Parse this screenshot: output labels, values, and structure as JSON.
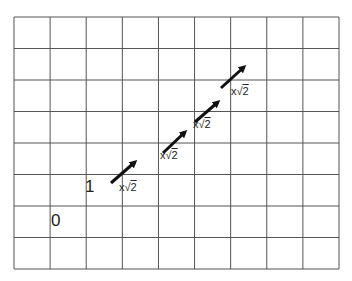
{
  "diagram": {
    "grid": {
      "columns": 9,
      "rows": 8,
      "left": 14,
      "top": 17,
      "right": 339,
      "bottom": 269,
      "line_color": "#555555"
    },
    "labels": [
      {
        "id": "zero",
        "text": "0",
        "x": 51,
        "y": 211
      },
      {
        "id": "one",
        "text": "1",
        "x": 85,
        "y": 177
      }
    ],
    "arrows": [
      {
        "from": [
          111,
          183
        ],
        "to": [
          135,
          162
        ],
        "label": {
          "prefix": "x",
          "radical": "√",
          "radicand": "2",
          "x": 119,
          "y": 181
        }
      },
      {
        "from": [
          163,
          153
        ],
        "to": [
          185,
          132
        ],
        "label": {
          "prefix": "x",
          "radical": "√",
          "radicand": "2",
          "x": 160,
          "y": 149
        }
      },
      {
        "from": [
          195,
          122
        ],
        "to": [
          218,
          102
        ],
        "label": {
          "prefix": "x",
          "radical": "√",
          "radicand": "2",
          "x": 193,
          "y": 118
        }
      },
      {
        "from": [
          221,
          88
        ],
        "to": [
          244,
          67
        ],
        "label": {
          "prefix": "x",
          "radical": "√",
          "radicand": "2",
          "x": 231,
          "y": 85
        }
      }
    ],
    "arrow_color": "#111111"
  }
}
